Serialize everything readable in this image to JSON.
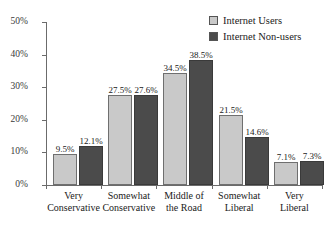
{
  "chart_data": {
    "type": "bar",
    "title": "",
    "subtitle": "",
    "xlabel": "",
    "ylabel": "",
    "ylim": [
      0,
      50
    ],
    "yticks": [
      "0%",
      "10%",
      "20%",
      "30%",
      "40%",
      "50%"
    ],
    "ytick_values": [
      0,
      10,
      20,
      30,
      40,
      50
    ],
    "grid": false,
    "legend_position": "top-right",
    "categories": [
      "Very\nConservative",
      "Somewhat\nConservative",
      "Middle of\nthe Road",
      "Somewhat\nLiberal",
      "Very\nLiberal"
    ],
    "category_lines": [
      [
        "Very",
        "Conservative"
      ],
      [
        "Somewhat",
        "Conservative"
      ],
      [
        "Middle of",
        "the Road"
      ],
      [
        "Somewhat",
        "Liberal"
      ],
      [
        "Very",
        "Liberal"
      ]
    ],
    "series": [
      {
        "name": "Internet Users",
        "color": "#c9c9c9",
        "values": [
          9.5,
          27.5,
          34.5,
          21.5,
          7.1
        ],
        "labels": [
          "9.5%",
          "27.5%",
          "34.5%",
          "21.5%",
          "7.1%"
        ]
      },
      {
        "name": "Internet Non-users",
        "color": "#4b4b4b",
        "values": [
          12.1,
          27.6,
          38.5,
          14.6,
          7.3
        ],
        "labels": [
          "12.1%",
          "27.6%",
          "38.5%",
          "14.6%",
          "7.3%"
        ]
      }
    ]
  },
  "legend": {
    "items": [
      {
        "label": "Internet Users",
        "color": "#c9c9c9"
      },
      {
        "label": "Internet Non-users",
        "color": "#4b4b4b"
      }
    ]
  },
  "axis": {
    "y_labels": [
      "50%",
      "40%",
      "30%",
      "20%",
      "10%",
      "0%"
    ],
    "axis_color": "#6b6b6b"
  }
}
